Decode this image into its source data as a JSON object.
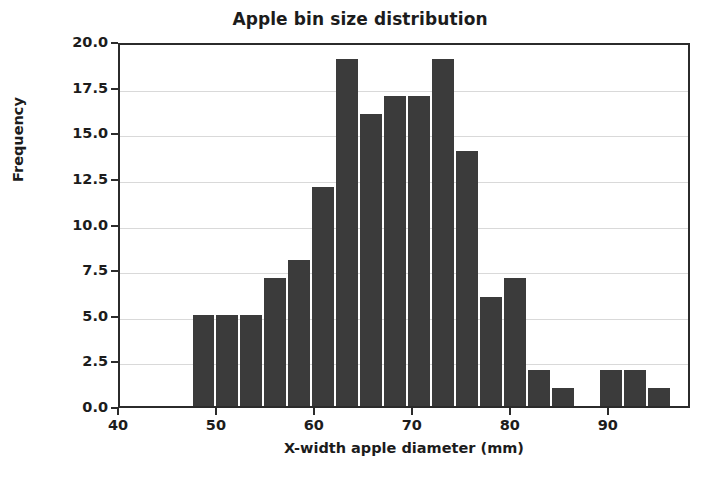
{
  "chart_data": {
    "type": "bar",
    "title": "Apple bin size distribution",
    "xlabel": "X-width apple diameter (mm)",
    "ylabel": "Frequency",
    "xlim": [
      40,
      98.4
    ],
    "ylim": [
      0.0,
      20.0
    ],
    "grid": true,
    "legend": null,
    "bar_color": "#3b3b3b",
    "bin_width": 2.45,
    "bin_edges": [
      47.3,
      49.75,
      52.2,
      54.65,
      57.1,
      59.55,
      62.0,
      64.45,
      66.9,
      69.35,
      71.8,
      74.25,
      76.7,
      79.15,
      81.6,
      84.05,
      86.5,
      88.95,
      91.4,
      93.85,
      96.3
    ],
    "categories": [
      "47.3-49.8",
      "49.8-52.2",
      "52.2-54.7",
      "54.7-57.1",
      "57.1-59.6",
      "59.6-62.0",
      "62.0-64.5",
      "64.5-66.9",
      "66.9-69.4",
      "69.4-71.8",
      "71.8-74.3",
      "74.3-76.7",
      "76.7-79.2",
      "79.2-81.6",
      "81.6-84.1",
      "84.1-86.5",
      "86.5-89.0",
      "89.0-91.4",
      "91.4-93.9",
      "93.9-96.3"
    ],
    "values": [
      5,
      5,
      5,
      7,
      8,
      12,
      19,
      16,
      17,
      17,
      19,
      14,
      6,
      7,
      2,
      1,
      0,
      2,
      2,
      1
    ],
    "x_ticks": [
      40,
      50,
      60,
      70,
      80,
      90
    ],
    "x_tick_labels": [
      "40",
      "50",
      "60",
      "70",
      "80",
      "90"
    ],
    "y_ticks": [
      0.0,
      2.5,
      5.0,
      7.5,
      10.0,
      12.5,
      15.0,
      17.5,
      20.0
    ],
    "y_tick_labels": [
      "0.0",
      "2.5",
      "5.0",
      "7.5",
      "10.0",
      "12.5",
      "15.0",
      "17.5",
      "20.0"
    ]
  }
}
